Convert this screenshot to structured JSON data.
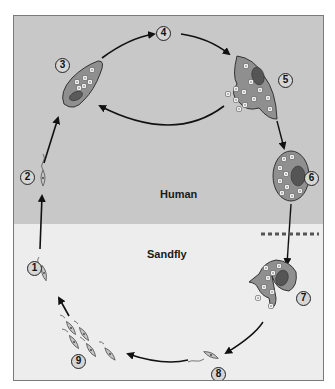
{
  "zones": {
    "human": {
      "label": "Human",
      "color": "#c8c8c8"
    },
    "sandfly": {
      "label": "Sandfly",
      "color": "#ededed"
    }
  },
  "stages": [
    {
      "n": "1",
      "desc": "promastigote injected"
    },
    {
      "n": "2",
      "desc": "promastigote"
    },
    {
      "n": "3",
      "desc": "macrophage with amastigotes"
    },
    {
      "n": "4",
      "desc": "multiplication"
    },
    {
      "n": "5",
      "desc": "macrophage rupturing, releasing amastigotes"
    },
    {
      "n": "6",
      "desc": "infected macrophage"
    },
    {
      "n": "7",
      "desc": "ingested macrophage releasing amastigotes"
    },
    {
      "n": "8",
      "desc": "promastigote"
    },
    {
      "n": "9",
      "desc": "dividing promastigotes"
    }
  ],
  "colors": {
    "cell_fill": "#8f8f8f",
    "cell_stroke": "#333333",
    "nucleus": "#5a5a5a",
    "arrow": "#111111",
    "dashed_line": "#555555"
  }
}
